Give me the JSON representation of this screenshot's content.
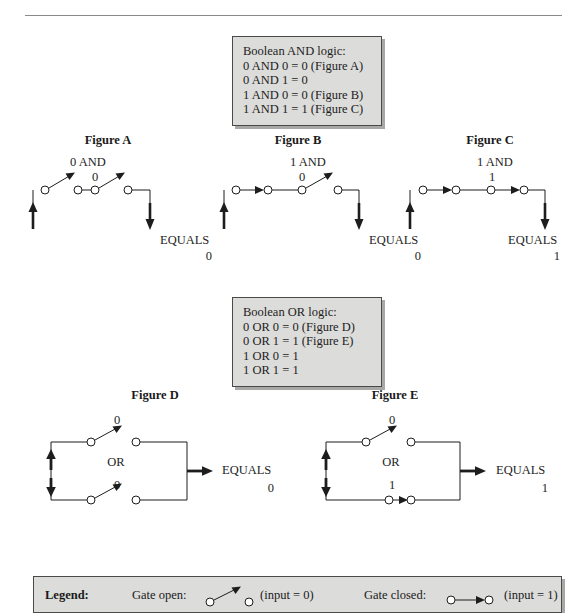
{
  "document": {
    "title": "Boolean logic gate diagrams",
    "top_rule": true
  },
  "and_box": {
    "heading": "Boolean AND logic:",
    "lines": [
      "0 AND 0 = 0 (Figure A)",
      "0 AND 1 = 0",
      "1 AND 0 = 0 (Figure B)",
      "1 AND 1 = 1 (Figure C)"
    ]
  },
  "or_box": {
    "heading": "Boolean OR logic:",
    "lines": [
      "0 OR 0 = 0 (Figure D)",
      "0 OR 1 = 1 (Figure E)",
      "1 OR 0 = 1",
      "1 OR 1 = 1"
    ]
  },
  "figures": {
    "a": {
      "title": "Figure A",
      "op_label": "0 AND",
      "second_input": "0",
      "equals_label": "EQUALS",
      "result": "0",
      "gate1_state": "open",
      "gate2_state": "open"
    },
    "b": {
      "title": "Figure B",
      "op_label": "1 AND",
      "second_input": "0",
      "equals_label": "EQUALS",
      "result": "0",
      "gate1_state": "closed",
      "gate2_state": "open"
    },
    "c": {
      "title": "Figure C",
      "op_label": "1 AND",
      "second_input": "1",
      "equals_label": "EQUALS",
      "result": "1",
      "gate1_state": "closed",
      "gate2_state": "closed"
    },
    "d": {
      "title": "Figure D",
      "top_input": "0",
      "op_label": "OR",
      "bottom_input": "0",
      "equals_label": "EQUALS",
      "result": "0",
      "top_gate_state": "open",
      "bottom_gate_state": "open"
    },
    "e": {
      "title": "Figure E",
      "top_input": "0",
      "op_label": "OR",
      "bottom_input": "1",
      "equals_label": "EQUALS",
      "result": "1",
      "top_gate_state": "open",
      "bottom_gate_state": "closed"
    }
  },
  "legend": {
    "label": "Legend:",
    "open_label": "Gate open:",
    "open_value": "(input = 0)",
    "closed_label": "Gate closed:",
    "closed_value": "(input = 1)"
  },
  "colors": {
    "ink": "#1d1d1d",
    "box_fill": "#dcdcda",
    "box_border": "#4a4a4a",
    "box_shadow": "#a8a8a6",
    "rule": "#8a8a8a"
  }
}
